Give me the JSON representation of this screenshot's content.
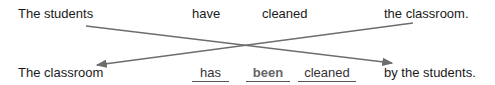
{
  "active_sentence": {
    "subject": "The students",
    "auxiliary": "have",
    "verb": "cleaned",
    "object": "the classroom."
  },
  "passive_sentence": {
    "subject": "The classroom",
    "blanks": [
      "has",
      "been",
      "cleaned"
    ],
    "agent": "by the students."
  },
  "arrow_color": "#6d6d6d"
}
